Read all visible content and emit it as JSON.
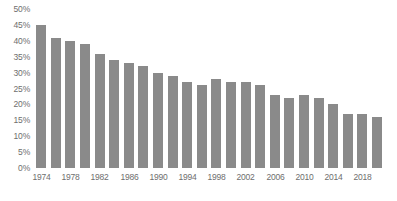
{
  "chart_data": {
    "type": "bar",
    "title": "",
    "subtitle": "",
    "xlabel": "",
    "ylabel": "",
    "categories": [
      "1974",
      "1976",
      "1978",
      "1980",
      "1982",
      "1984",
      "1986",
      "1988",
      "1990",
      "1992",
      "1994",
      "1996",
      "1998",
      "2000",
      "2002",
      "2004",
      "2006",
      "2008",
      "2010",
      "2012",
      "2014",
      "2016",
      "2018",
      "2020"
    ],
    "values": [
      45,
      41,
      40,
      39,
      36,
      34,
      33,
      32,
      30,
      29,
      27,
      26,
      28,
      27,
      27,
      26,
      23,
      22,
      23,
      22,
      20,
      17,
      17,
      16
    ],
    "ylim": [
      0,
      50
    ],
    "ytick_values": [
      0,
      5,
      10,
      15,
      20,
      25,
      30,
      35,
      40,
      45,
      50
    ],
    "ytick_labels": [
      "0%",
      "5%",
      "10%",
      "15%",
      "20%",
      "25%",
      "30%",
      "35%",
      "40%",
      "45%",
      "50%"
    ],
    "xtick_labels": [
      "1974",
      "1978",
      "1982",
      "1986",
      "1990",
      "1994",
      "1998",
      "2002",
      "2006",
      "2010",
      "2014",
      "2018"
    ],
    "xtick_indices": [
      0,
      2,
      4,
      6,
      8,
      10,
      12,
      14,
      16,
      18,
      20,
      22
    ],
    "grid": false,
    "legend": null,
    "series_color": "#8a8a8a",
    "axis_text_color": "#6e6e6e",
    "background_color": "#ffffff"
  }
}
